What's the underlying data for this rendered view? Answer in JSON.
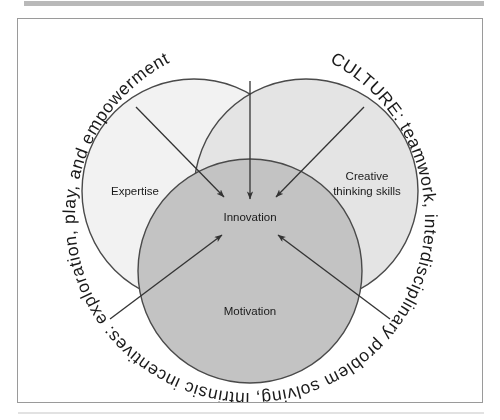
{
  "figure": {
    "type": "venn-diagram",
    "ring_text": "CULTURE: teamwork, interdisciplinary problem solving, intrinsic incentives: exploration, play, and empowerment",
    "center_label": "Innovation",
    "circles": [
      {
        "id": "expertise",
        "label": "Expertise",
        "fill": "#f2f2f2"
      },
      {
        "id": "creative",
        "label": "Creative\nthinking skills",
        "fill": "#e4e4e4"
      },
      {
        "id": "motivation",
        "label": "Motivation",
        "fill": "#c3c3c3"
      }
    ],
    "circle_labels": {
      "expertise": "Expertise",
      "creative_line1": "Creative",
      "creative_line2": "thinking skills",
      "motivation": "Motivation"
    },
    "colors": {
      "stroke": "#4a4a4a",
      "text": "#1a1a1a",
      "panel_border": "#9a9a9a",
      "top_rule": "#b9b9b9",
      "expertise_fill": "#f2f2f2",
      "creative_fill": "#e4e4e4",
      "motivation_fill": "#c3c3c3",
      "background": "#ffffff"
    },
    "arrow_count": 5
  }
}
